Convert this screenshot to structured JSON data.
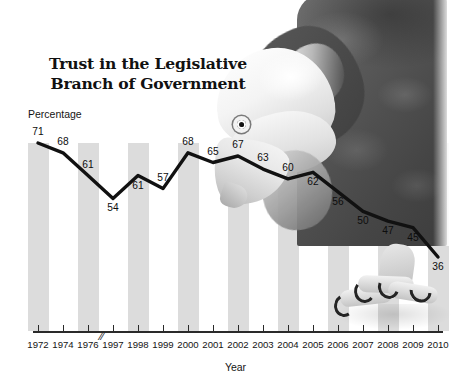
{
  "chart_data": {
    "type": "line",
    "title": "Trust in the Legislative Branch of Government",
    "xlabel": "Year",
    "ylabel": "Percentage",
    "categories": [
      "1972",
      "1974",
      "1976",
      "1997",
      "1998",
      "1999",
      "2000",
      "2001",
      "2002",
      "2003",
      "2004",
      "2005",
      "2006",
      "2007",
      "2008",
      "2009",
      "2010"
    ],
    "values": [
      71,
      68,
      61,
      54,
      61,
      57,
      68,
      65,
      67,
      63,
      60,
      62,
      56,
      50,
      47,
      45,
      36
    ],
    "point_labels": [
      "71",
      "68",
      "61",
      "54",
      "61",
      "57",
      "68",
      "65",
      "67",
      "63",
      "60",
      "62",
      "56",
      "50",
      "47",
      "45",
      "36"
    ],
    "label_positions": [
      "above",
      "above",
      "above",
      "below",
      "below",
      "above",
      "above",
      "above",
      "above",
      "above",
      "above",
      "below",
      "below",
      "below",
      "below",
      "below",
      "below"
    ],
    "ylim": [
      0,
      78
    ],
    "grid": false,
    "legend": null,
    "axis_break_after_category": "1976",
    "axis_break_glyph": "//",
    "banded_categories": [
      "1972",
      "1976",
      "1998",
      "2000",
      "2002",
      "2004",
      "2006",
      "2008",
      "2010"
    ],
    "band_color": "#dcdcdc",
    "line_color": "#111111",
    "background_color": "#ffffff",
    "annotation_image": "bald-eagle-photo"
  }
}
